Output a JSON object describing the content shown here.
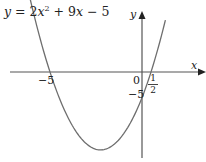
{
  "chart_data": {
    "type": "line",
    "equation": {
      "lhs": "y",
      "rhs_terms": [
        "2x",
        "2",
        "+ 9x − 5"
      ],
      "coefficients": {
        "a": 2,
        "b": 9,
        "c": -5
      }
    },
    "xlabel": "x",
    "ylabel": "y",
    "series": [
      {
        "name": "y = 2x^2 + 9x - 5",
        "x": [
          -7.3,
          -6,
          -5,
          -4,
          -3,
          -2.25,
          -1,
          0,
          0.5,
          1.3
        ],
        "values": [
          9.88,
          13,
          0,
          -9,
          -14,
          -15.125,
          -12,
          -5,
          0,
          10.08
        ]
      }
    ],
    "annotations": {
      "x_intercepts": [
        {
          "x": -5,
          "label": "−5"
        },
        {
          "x": 0.5,
          "label_num": "1",
          "label_den": "2"
        }
      ],
      "y_intercept": {
        "y": -5,
        "label": "−5"
      },
      "origin_label": "0",
      "vertex": {
        "x": -2.25,
        "y": -15.125
      }
    },
    "xlim": [
      -7.3,
      3.4
    ],
    "ylim": [
      -16.5,
      11.5
    ],
    "grid": false,
    "legend": "none"
  },
  "labels": {
    "eq_y": "y",
    "eq_eq": " = 2",
    "eq_x": "x",
    "eq_sq": "2",
    "eq_rest1": " + 9",
    "eq_x2": "x",
    "eq_rest2": " − 5",
    "x_axis": "x",
    "y_axis": "y",
    "tick_neg5_x": "−5",
    "tick_origin": "0",
    "tick_neg5_y": "−5",
    "frac_num": "1",
    "frac_den": "2"
  },
  "colors": {
    "axis": "#555555",
    "curve": "#6e6e6e",
    "text": "#222222"
  }
}
